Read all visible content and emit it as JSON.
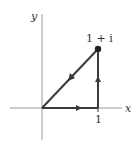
{
  "diagram": {
    "axes": {
      "x_label": "x",
      "y_label": "y",
      "color": "#9a9a9a"
    },
    "points": {
      "origin": {
        "label": ""
      },
      "one": {
        "label": "1"
      },
      "one_plus_i": {
        "label": "1 + i"
      }
    },
    "path": {
      "color": "#3a3a3a",
      "segments": [
        {
          "from": "0",
          "to": "1",
          "direction": "right"
        },
        {
          "from": "1",
          "to": "1 + i",
          "direction": "up"
        },
        {
          "from": "1 + i",
          "to": "0",
          "direction": "down-left"
        }
      ]
    }
  }
}
